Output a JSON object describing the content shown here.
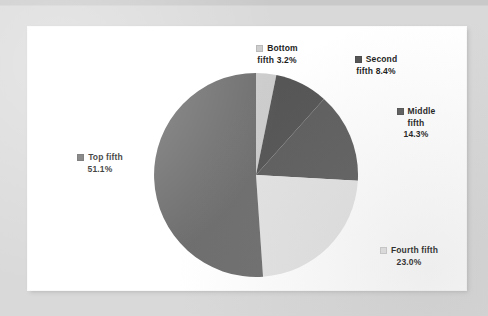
{
  "chart_data": {
    "type": "pie",
    "title": "",
    "legend_position": "callouts",
    "categories": [
      "Bottom fifth",
      "Second fifth",
      "Middle fifth",
      "Fourth fifth",
      "Top fifth"
    ],
    "values": [
      3.2,
      8.4,
      14.3,
      23.0,
      51.1
    ],
    "value_suffix": "%",
    "start_angle_deg": 0,
    "direction": "clockwise",
    "slices": [
      {
        "name": "Bottom fifth",
        "label_line1": "Bottom",
        "label_line2": "fifth 3.2%",
        "value": 3.2,
        "value_text": "3.2%",
        "color": "#cccccc"
      },
      {
        "name": "Second fifth",
        "label_line1": "Second",
        "label_line2": "fifth 8.4%",
        "value": 8.4,
        "value_text": "8.4%",
        "color": "#555555"
      },
      {
        "name": "Middle fifth",
        "label_line1": "Middle",
        "label_line2": "fifth",
        "label_line3": "14.3%",
        "value": 14.3,
        "value_text": "14.3%",
        "color": "#5e5e5e"
      },
      {
        "name": "Fourth fifth",
        "label_line1": "Fourth fifth",
        "label_line2": "23.0%",
        "value": 23.0,
        "value_text": "23.0%",
        "color": "#e3e3e3"
      },
      {
        "name": "Top fifth",
        "label_line1": "Top fifth",
        "label_line2": "51.1%",
        "value": 51.1,
        "value_text": "51.1%",
        "color": "#6e6e6e"
      }
    ]
  },
  "colors": {
    "page_background": "#d9d9d9",
    "panel_background": "#ffffff",
    "text": "#1c1c1c",
    "bottom_fifth": "#cccccc",
    "second_fifth": "#555555",
    "middle_fifth": "#5e5e5e",
    "fourth_fifth": "#e3e3e3",
    "top_fifth": "#6e6e6e"
  }
}
